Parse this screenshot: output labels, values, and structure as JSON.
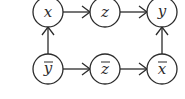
{
  "diagram": {
    "nodes": [
      {
        "id": "x",
        "label": "x",
        "bar": false,
        "cx": 48,
        "cy": 12
      },
      {
        "id": "z",
        "label": "z",
        "bar": false,
        "cx": 105,
        "cy": 12
      },
      {
        "id": "y",
        "label": "y",
        "bar": false,
        "cx": 162,
        "cy": 12
      },
      {
        "id": "ybar",
        "label": "y",
        "bar": true,
        "cx": 48,
        "cy": 69
      },
      {
        "id": "zbar",
        "label": "z",
        "bar": true,
        "cx": 105,
        "cy": 69
      },
      {
        "id": "xbar",
        "label": "x",
        "bar": true,
        "cx": 162,
        "cy": 69
      }
    ],
    "edges": [
      {
        "from": "x",
        "to": "z"
      },
      {
        "from": "z",
        "to": "y"
      },
      {
        "from": "ybar",
        "to": "x"
      },
      {
        "from": "ybar",
        "to": "zbar"
      },
      {
        "from": "zbar",
        "to": "xbar"
      },
      {
        "from": "xbar",
        "to": "y"
      }
    ],
    "colors": {
      "stroke": "#2b2b2b",
      "background": "#ffffff"
    }
  }
}
